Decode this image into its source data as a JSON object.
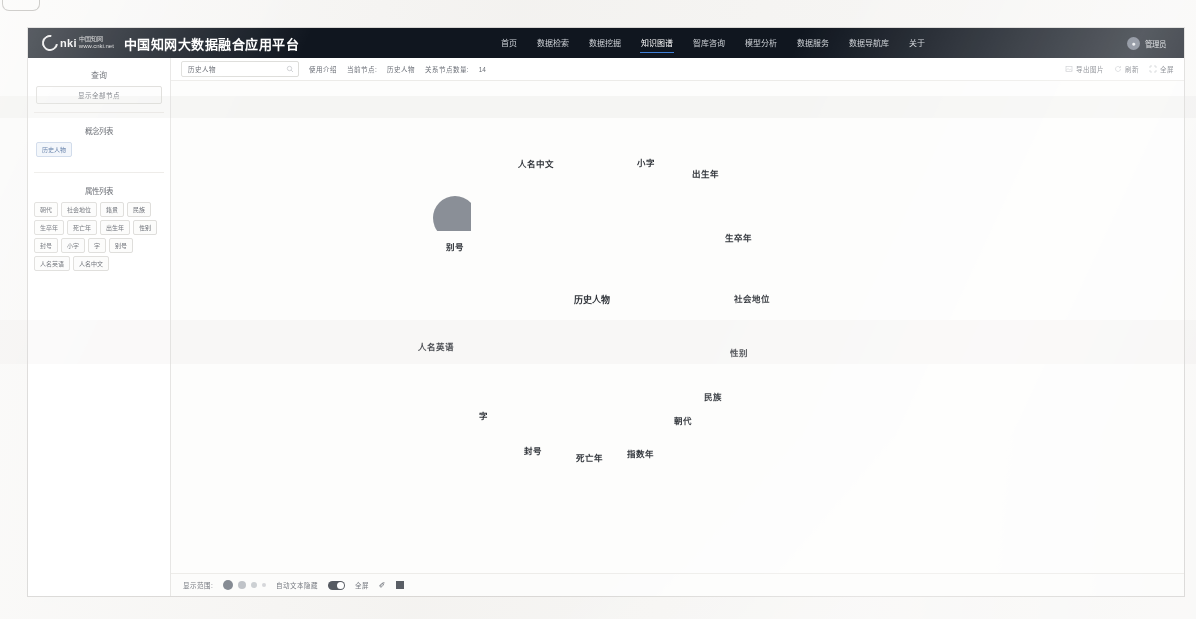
{
  "header": {
    "logo_word": "nki",
    "logo_cn_line1": "中国知网",
    "logo_cn_line2": "www.cnki.net",
    "title": "中国知网大数据融合应用平台",
    "nav": [
      {
        "label": "首页",
        "active": false
      },
      {
        "label": "数据检索",
        "active": false
      },
      {
        "label": "数据挖掘",
        "active": false
      },
      {
        "label": "知识图谱",
        "active": true
      },
      {
        "label": "智库咨询",
        "active": false
      },
      {
        "label": "模型分析",
        "active": false
      },
      {
        "label": "数据服务",
        "active": false
      },
      {
        "label": "数据导航库",
        "active": false
      },
      {
        "label": "关于",
        "active": false
      }
    ],
    "user_name": "管理员",
    "avatar_icon": "user-icon"
  },
  "sidebar": {
    "title": "查询",
    "show_all_button": "显示全部节点",
    "concept_section_label": "概念列表",
    "concepts": [
      {
        "label": "历史人物",
        "selected": true
      }
    ],
    "attribute_section_label": "属性列表",
    "attributes": [
      "朝代",
      "社会地位",
      "籍贯",
      "民族",
      "生卒年",
      "死亡年",
      "出生年",
      "性别",
      "封号",
      "小字",
      "字",
      "别号",
      "人名英语",
      "人名中文"
    ]
  },
  "toolbar": {
    "search_value": "历史人物",
    "search_placeholder": "请输入节点名称",
    "search_icon": "search-icon",
    "help_link": "使用介绍",
    "current_node_label": "当前节点:",
    "current_node_value": "历史人物",
    "relation_count_label": "关系节点数量:",
    "relation_count_value": "14",
    "export_image": "导出图片",
    "refresh": "刷新",
    "fullscreen": "全屏",
    "export_icon": "export-image-icon",
    "refresh_icon": "refresh-icon",
    "fullscreen_icon": "fullscreen-icon"
  },
  "graph": {
    "node_color": "#8a8f97",
    "edge_color": "#b9bcc1",
    "center": {
      "label": "历史人物",
      "x": 592,
      "y": 278,
      "r": 25
    },
    "nodes": [
      {
        "label": "人名中文",
        "x": 536,
        "y": 137,
        "r": 24,
        "label_y": 156
      },
      {
        "label": "小字",
        "x": 646,
        "y": 135,
        "r": 21,
        "label_y": 155
      },
      {
        "label": "出生年",
        "x": 705,
        "y": 153,
        "r": 21,
        "label_y": 166
      },
      {
        "label": "生卒年",
        "x": 738,
        "y": 212,
        "r": 22,
        "label_y": 230
      },
      {
        "label": "社会地位",
        "x": 752,
        "y": 278,
        "r": 22,
        "label_y": 291
      },
      {
        "label": "性别",
        "x": 739,
        "y": 331,
        "r": 22,
        "label_y": 345
      },
      {
        "label": "民族",
        "x": 713,
        "y": 379,
        "r": 22,
        "label_y": 389
      },
      {
        "label": "朝代",
        "x": 683,
        "y": 404,
        "r": 22,
        "label_y": 413
      },
      {
        "label": "指数年",
        "x": 640,
        "y": 432,
        "r": 22,
        "label_y": 446
      },
      {
        "label": "死亡年",
        "x": 589,
        "y": 437,
        "r": 22,
        "label_y": 450
      },
      {
        "label": "封号",
        "x": 533,
        "y": 428,
        "r": 22,
        "label_y": 443
      },
      {
        "label": "字",
        "x": 483,
        "y": 396,
        "r": 22,
        "label_y": 408
      },
      {
        "label": "人名英语",
        "x": 436,
        "y": 314,
        "r": 24,
        "label_y": 339
      },
      {
        "label": "别号",
        "x": 455,
        "y": 217,
        "r": 22,
        "label_y": 239
      }
    ]
  },
  "bottombar": {
    "scope_label": "显示范围:",
    "auto_hide_label": "自动文本隐藏",
    "fullscreen_label": "全屏",
    "pen_icon": "pen-icon",
    "stop_icon": "stop-square-icon"
  }
}
